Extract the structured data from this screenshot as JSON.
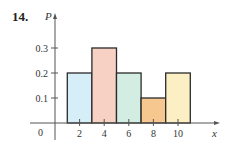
{
  "problem": {
    "number": "14."
  },
  "chart_data": {
    "type": "bar",
    "title": "",
    "xlabel": "x",
    "ylabel": "P",
    "categories": [
      "2",
      "4",
      "6",
      "8",
      "10"
    ],
    "bins": [
      [
        1,
        3
      ],
      [
        3,
        5
      ],
      [
        5,
        7
      ],
      [
        7,
        9
      ],
      [
        9,
        11
      ]
    ],
    "values": [
      0.2,
      0.3,
      0.2,
      0.1,
      0.2
    ],
    "colors": [
      "#d6eef8",
      "#f7d2c4",
      "#d3ede2",
      "#f6c890",
      "#fcefc4"
    ],
    "x_ticks": [
      "2",
      "4",
      "6",
      "8",
      "10"
    ],
    "y_ticks": [
      "0.1",
      "0.2",
      "0.3"
    ],
    "origin_label": "0",
    "ylim": [
      0,
      0.38
    ],
    "xlim": [
      0,
      13
    ],
    "grid": false,
    "legend": null
  }
}
